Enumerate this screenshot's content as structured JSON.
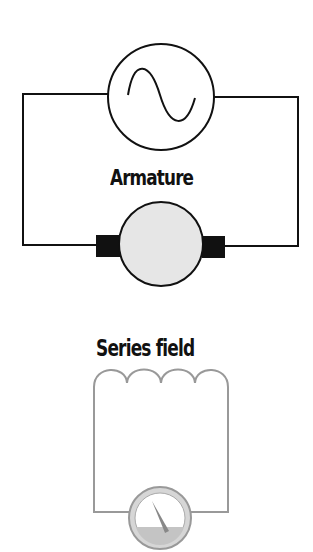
{
  "diagram": {
    "armature_circuit": {
      "label": "Armature",
      "source_symbol": "ac-sine-wave",
      "component": "armature-with-brushes",
      "wire_color": "#111111"
    },
    "field_circuit": {
      "label": "Series field",
      "component": "coil-4-loops",
      "meter_symbol": "analog-meter-gauge",
      "wire_color": "#9a9a9a"
    }
  }
}
